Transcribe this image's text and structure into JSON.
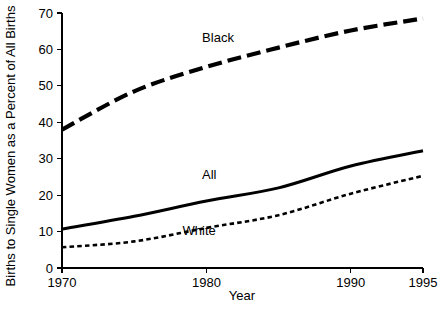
{
  "chart_data": {
    "type": "line",
    "title": "",
    "xlabel": "Year",
    "ylabel": "Births to Single Women as a Percent of All Births",
    "xlim": [
      1970,
      1995
    ],
    "ylim": [
      0,
      70
    ],
    "xticks": [
      1970,
      1980,
      1990,
      1995
    ],
    "xticklabels": [
      "1970",
      "1980",
      "1990",
      "1995"
    ],
    "yticks": [
      0,
      10,
      20,
      30,
      40,
      50,
      60,
      70
    ],
    "yticklabels": [
      "0",
      "10",
      "20",
      "30",
      "40",
      "50",
      "60",
      "70"
    ],
    "grid": false,
    "legend_position": "inline-annotations",
    "x": [
      1970,
      1975,
      1980,
      1985,
      1990,
      1995
    ],
    "series": [
      {
        "name": "Black",
        "label": "Black",
        "linestyle": "long-dashed",
        "color": "#000000",
        "values": [
          38.0,
          48.5,
          55.2,
          60.5,
          65.2,
          68.5
        ]
      },
      {
        "name": "All",
        "label": "All",
        "linestyle": "solid",
        "color": "#000000",
        "values": [
          10.7,
          14.2,
          18.4,
          22.0,
          28.0,
          32.2
        ]
      },
      {
        "name": "White",
        "label": "White",
        "linestyle": "short-dashed",
        "color": "#000000",
        "values": [
          5.7,
          7.3,
          11.0,
          14.5,
          20.4,
          25.3
        ]
      }
    ],
    "annotations": [
      {
        "text": "Black",
        "x": 1980.8,
        "y": 62.0
      },
      {
        "text": "All",
        "x": 1980.2,
        "y": 24.5
      },
      {
        "text": "White",
        "x": 1979.5,
        "y": 9.0
      }
    ]
  }
}
